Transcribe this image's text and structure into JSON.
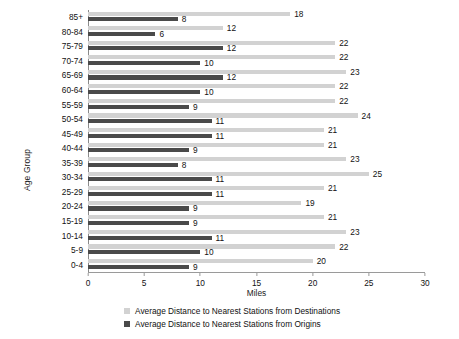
{
  "chart_data": {
    "type": "bar",
    "orientation": "horizontal",
    "title": "",
    "xlabel": "Miles",
    "ylabel": "Age Group",
    "xlim": [
      0,
      30
    ],
    "xticks": [
      0,
      5,
      10,
      15,
      20,
      25,
      30
    ],
    "grid": false,
    "legend_position": "bottom",
    "categories": [
      "85+",
      "80-84",
      "75-79",
      "70-74",
      "65-69",
      "60-64",
      "55-59",
      "50-54",
      "45-49",
      "40-44",
      "35-39",
      "30-34",
      "25-29",
      "20-24",
      "15-19",
      "10-14",
      "5-9",
      "0-4"
    ],
    "series": [
      {
        "name": "Average Distance to Nearest Stations from Destinations",
        "color": "#d2d2d2",
        "values": [
          18,
          12,
          22,
          22,
          23,
          22,
          22,
          24,
          21,
          21,
          23,
          25,
          21,
          19,
          21,
          23,
          22,
          20
        ]
      },
      {
        "name": "Average Distance to Nearest Stations from Origins",
        "color": "#4a4a4a",
        "values": [
          8,
          6,
          12,
          10,
          12,
          10,
          9,
          11,
          11,
          9,
          8,
          11,
          11,
          9,
          9,
          11,
          10,
          9
        ]
      }
    ]
  },
  "legend": {
    "items": [
      {
        "label": "Average Distance to Nearest Stations from Destinations",
        "swatch": "light"
      },
      {
        "label": "Average Distance to Nearest Stations from Origins",
        "swatch": "dark"
      }
    ]
  },
  "axes": {
    "x_title": "Miles",
    "y_title": "Age Group"
  }
}
